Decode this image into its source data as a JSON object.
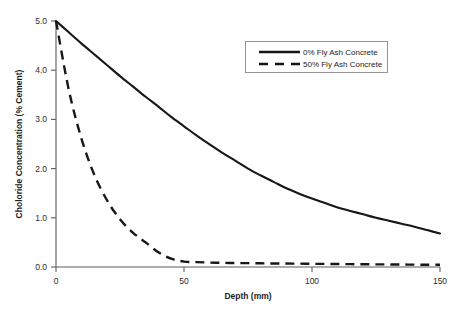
{
  "chart_data": {
    "type": "line",
    "title": "",
    "xlabel": "Depth (mm)",
    "ylabel": "Choloride Concentration (% Cement)",
    "xlim": [
      0,
      150
    ],
    "ylim": [
      0,
      5.0
    ],
    "xticks": [
      "0",
      "50",
      "100",
      "150"
    ],
    "xtick_values": [
      0,
      50,
      100,
      150
    ],
    "yticks": [
      "0.0",
      "1.0",
      "2.0",
      "3.0",
      "4.0",
      "5.0"
    ],
    "ytick_values": [
      0.0,
      1.0,
      2.0,
      3.0,
      4.0,
      5.0
    ],
    "grid": false,
    "legend_position": "upper right",
    "x": [
      0,
      5,
      10,
      15,
      20,
      25,
      30,
      35,
      40,
      45,
      50,
      55,
      60,
      65,
      70,
      75,
      80,
      85,
      90,
      95,
      100,
      105,
      110,
      115,
      120,
      125,
      130,
      135,
      140,
      145,
      150
    ],
    "series": [
      {
        "name": "0% Fly Ash Concrete",
        "style": "solid",
        "color": "#171717",
        "values": [
          5.0,
          4.77,
          4.54,
          4.32,
          4.1,
          3.88,
          3.67,
          3.46,
          3.26,
          3.05,
          2.86,
          2.67,
          2.49,
          2.32,
          2.16,
          2.0,
          1.86,
          1.73,
          1.6,
          1.49,
          1.39,
          1.3,
          1.21,
          1.14,
          1.07,
          1.0,
          0.94,
          0.88,
          0.82,
          0.75,
          0.68
        ]
      },
      {
        "name": "50% Fly Ash Concrete",
        "style": "dashed",
        "color": "#171717",
        "values": [
          5.0,
          3.6,
          2.6,
          1.87,
          1.35,
          0.97,
          0.7,
          0.5,
          0.3,
          0.17,
          0.11,
          0.1,
          0.09,
          0.085,
          0.08,
          0.078,
          0.075,
          0.072,
          0.07,
          0.068,
          0.065,
          0.063,
          0.06,
          0.058,
          0.056,
          0.054,
          0.052,
          0.05,
          0.048,
          0.046,
          0.045
        ]
      }
    ]
  },
  "legend": {
    "entries": [
      {
        "label": "0% Fly Ash Concrete",
        "style": "solid"
      },
      {
        "label": "50% Fly Ash Concrete",
        "style": "dashed"
      }
    ]
  },
  "axes": {
    "x_title": "Depth (mm)",
    "y_title": "Choloride Concentration (% Cement)",
    "x_tick_labels": [
      "0",
      "50",
      "100",
      "150"
    ],
    "y_tick_labels": [
      "0.0",
      "1.0",
      "2.0",
      "3.0",
      "4.0",
      "5.0"
    ]
  }
}
